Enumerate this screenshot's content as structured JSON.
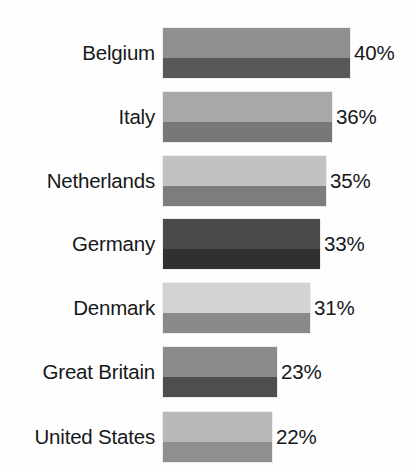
{
  "chart_data": {
    "type": "bar",
    "orientation": "horizontal",
    "title": "",
    "subtitle": "",
    "xlabel": "",
    "ylabel": "",
    "grid": false,
    "legend": "none",
    "xlim": [
      0,
      44
    ],
    "value_suffix": "%",
    "categories": [
      "Belgium",
      "Italy",
      "Netherlands",
      "Germany",
      "Denmark",
      "Great Britain",
      "United States"
    ],
    "values": [
      40,
      36,
      35,
      33,
      31,
      23,
      22
    ],
    "value_labels": [
      "40%",
      "36%",
      "35%",
      "33%",
      "31%",
      "23%",
      "22%"
    ],
    "bars": [
      {
        "category": "Belgium",
        "value": 40,
        "value_label": "40%",
        "top_px": 28,
        "height_px": 50,
        "width_px": 187,
        "color_top": "#909090",
        "color_bottom": "#585858"
      },
      {
        "category": "Italy",
        "value": 36,
        "value_label": "36%",
        "top_px": 92,
        "height_px": 50,
        "width_px": 169,
        "color_top": "#a8a8a8",
        "color_bottom": "#787878"
      },
      {
        "category": "Netherlands",
        "value": 35,
        "value_label": "35%",
        "top_px": 156,
        "height_px": 50,
        "width_px": 163,
        "color_top": "#c2c2c2",
        "color_bottom": "#7d7d7d"
      },
      {
        "category": "Germany",
        "value": 33,
        "value_label": "33%",
        "top_px": 219,
        "height_px": 50,
        "width_px": 157,
        "color_top": "#4a4a4a",
        "color_bottom": "#303030"
      },
      {
        "category": "Denmark",
        "value": 31,
        "value_label": "31%",
        "top_px": 283,
        "height_px": 50,
        "width_px": 147,
        "color_top": "#d4d4d4",
        "color_bottom": "#8a8a8a"
      },
      {
        "category": "Great Britain",
        "value": 23,
        "value_label": "23%",
        "top_px": 347,
        "height_px": 50,
        "width_px": 114,
        "color_top": "#8b8b8b",
        "color_bottom": "#4e4e4e"
      },
      {
        "category": "United States",
        "value": 22,
        "value_label": "22%",
        "top_px": 412,
        "height_px": 50,
        "width_px": 109,
        "color_top": "#b9b9b9",
        "color_bottom": "#8f8f8f"
      }
    ],
    "background_color": "#fefefe",
    "text_color": "#16181a"
  }
}
